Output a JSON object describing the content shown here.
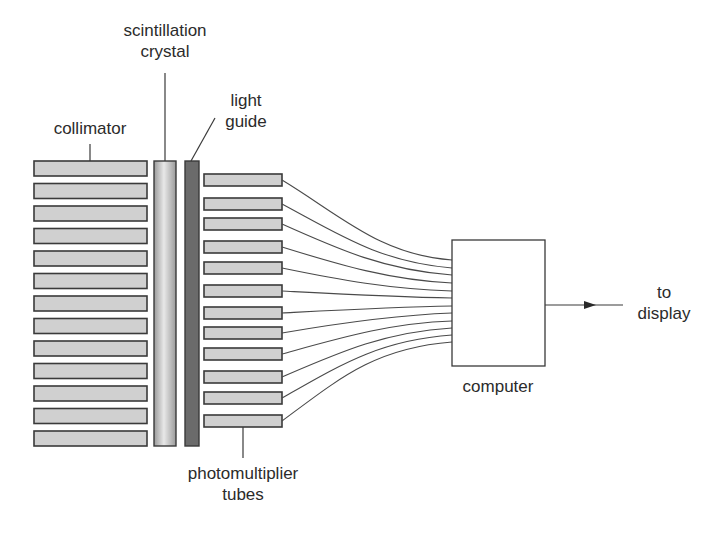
{
  "diagram": {
    "labels": {
      "scintillation_crystal": [
        "scintillation",
        "crystal"
      ],
      "light_guide": [
        "light",
        "guide"
      ],
      "collimator": "collimator",
      "photomultiplier_tubes": [
        "photomultiplier",
        "tubes"
      ],
      "computer": "computer",
      "to_display": [
        "to",
        "display"
      ]
    },
    "components": {
      "collimator_bars": 13,
      "photomultiplier_tube_count": 12
    },
    "colors": {
      "bar_fill": "#d0d0d0",
      "bar_stroke": "#3a3a3a",
      "light_guide_fill": "#6b6b6b",
      "crystal_gradient": [
        "#9a9a9a",
        "#e8e8e8",
        "#9a9a9a"
      ],
      "line": "#3a3a3a"
    }
  }
}
